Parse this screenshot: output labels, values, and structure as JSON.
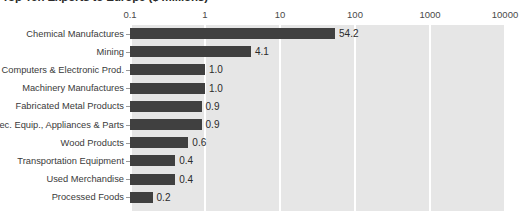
{
  "chart_data": {
    "type": "bar",
    "orientation": "horizontal",
    "title": "Top Ten Exports to Europe ($ millions)",
    "xlabel": "",
    "ylabel": "",
    "xscale": "log",
    "xlim": [
      0.1,
      10000
    ],
    "grid": true,
    "legend": null,
    "xticks": [
      "0.1",
      "1",
      "10",
      "100",
      "1000",
      "10000"
    ],
    "xtick_values": [
      0.1,
      1,
      10,
      100,
      1000,
      10000
    ],
    "categories": [
      "Chemical Manufactures",
      "Mining",
      "Computers & Electronic Prod.",
      "Machinery Manufactures",
      "Fabricated Metal Products",
      "Elec. Equip., Appliances & Parts",
      "Wood Products",
      "Transportation Equipment",
      "Used Merchandise",
      "Processed Foods"
    ],
    "values": [
      54.2,
      4.1,
      1.0,
      1.0,
      0.9,
      0.9,
      0.6,
      0.4,
      0.4,
      0.2
    ],
    "data_labels": [
      "54.2",
      "4.1",
      "1.0",
      "1.0",
      "0.9",
      "0.9",
      "0.6",
      "0.4",
      "0.4",
      "0.2"
    ]
  },
  "colors": {
    "bar": "#404040",
    "plot_background": "#e6e6e6",
    "gridline": "#ffffff",
    "text": "#3a3a3a",
    "page_background": "#ffffff"
  }
}
